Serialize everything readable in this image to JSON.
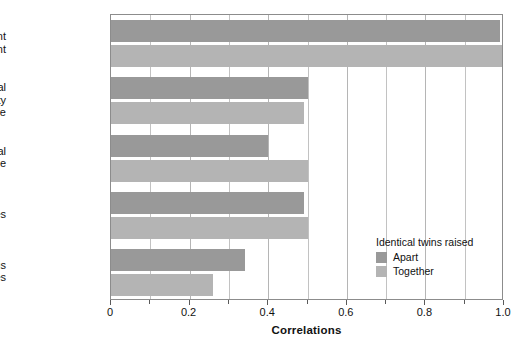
{
  "chart_data": {
    "type": "bar",
    "orientation": "horizontal",
    "title": "",
    "xlabel": "Correlations",
    "ylabel": "",
    "xlim": [
      0,
      1.0
    ],
    "xticks": [
      0,
      0.2,
      0.4,
      0.6,
      0.8,
      1.0
    ],
    "xtick_labels": [
      "0",
      "0.2",
      "0.4",
      "0.6",
      "0.8",
      "1.0"
    ],
    "minor_tick_step": 0.1,
    "grid": true,
    "grid_axis": "x",
    "legend_position": "inside-lower-right",
    "categories": [
      "Fingerprint\nridge count",
      "Multidimensional\npersonality\nquestionnaire",
      "Occupational\ninterest scale",
      "Religious attitudes",
      "Nonreligious\nsocial attitudes"
    ],
    "series": [
      {
        "name": "Apart",
        "color": "#999999",
        "values": [
          0.99,
          0.5,
          0.4,
          0.49,
          0.34
        ]
      },
      {
        "name": "Together",
        "color": "#b4b4b4",
        "values": [
          1.0,
          0.49,
          0.5,
          0.5,
          0.26
        ]
      }
    ]
  },
  "legend": {
    "title": "Identical twins raised",
    "entries": [
      {
        "label": "Apart"
      },
      {
        "label": "Together"
      }
    ]
  }
}
